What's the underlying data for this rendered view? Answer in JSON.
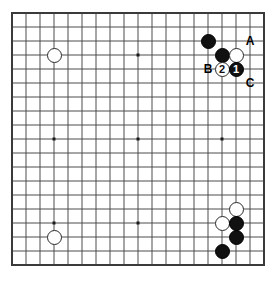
{
  "diagram": {
    "board_size": 19,
    "colors": {
      "background": "#ffffff",
      "grid_line": "#4d4d4d",
      "border_line": "#3a3a3a",
      "black_stone": "#111111",
      "white_stone": "#ffffff",
      "white_stone_edge": "#2a2a2a",
      "label_text": "#000000"
    },
    "geometry": {
      "origin_x": 12,
      "origin_y": 13,
      "cell": 14,
      "stone_diameter": 15,
      "star_dot": 3
    },
    "star_points": [
      {
        "col": 3,
        "row": 3
      },
      {
        "col": 9,
        "row": 3
      },
      {
        "col": 15,
        "row": 3
      },
      {
        "col": 3,
        "row": 9
      },
      {
        "col": 9,
        "row": 9
      },
      {
        "col": 15,
        "row": 9
      },
      {
        "col": 3,
        "row": 15
      },
      {
        "col": 9,
        "row": 15
      },
      {
        "col": 15,
        "row": 15
      }
    ],
    "stones": [
      {
        "id": "w-upper-left-star",
        "color": "white",
        "col": 3,
        "row": 3,
        "label": ""
      },
      {
        "id": "w-lower-left-star",
        "color": "white",
        "col": 3,
        "row": 16,
        "label": ""
      },
      {
        "id": "b-top-right-high",
        "color": "black",
        "col": 14,
        "row": 2,
        "label": ""
      },
      {
        "id": "b-top-right-mid",
        "color": "black",
        "col": 15,
        "row": 3,
        "label": ""
      },
      {
        "id": "w-top-right-mid",
        "color": "white",
        "col": 16,
        "row": 3,
        "label": ""
      },
      {
        "id": "w-move-2",
        "color": "white",
        "col": 15,
        "row": 4,
        "label": "2"
      },
      {
        "id": "b-move-1",
        "color": "black",
        "col": 16,
        "row": 4,
        "label": "1"
      },
      {
        "id": "w-bottom-right-high",
        "color": "white",
        "col": 16,
        "row": 14,
        "label": ""
      },
      {
        "id": "w-bottom-right-left",
        "color": "white",
        "col": 15,
        "row": 15,
        "label": ""
      },
      {
        "id": "b-bottom-right-upper",
        "color": "black",
        "col": 16,
        "row": 15,
        "label": ""
      },
      {
        "id": "b-bottom-right-lower",
        "color": "black",
        "col": 16,
        "row": 16,
        "label": ""
      },
      {
        "id": "b-bottom-right-tail",
        "color": "black",
        "col": 15,
        "row": 17,
        "label": ""
      }
    ],
    "point_marks": [
      {
        "id": "mark-a",
        "text": "A",
        "col": 17,
        "row": 2
      },
      {
        "id": "mark-b",
        "text": "B",
        "col": 14,
        "row": 4
      },
      {
        "id": "mark-c",
        "text": "C",
        "col": 17,
        "row": 5
      }
    ]
  }
}
